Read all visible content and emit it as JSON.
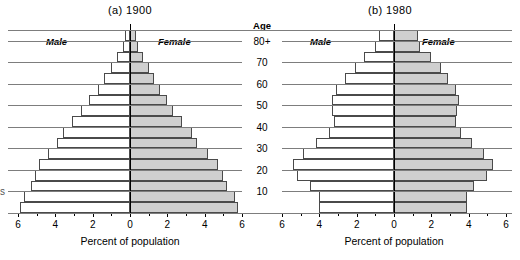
{
  "figure": {
    "age_axis_header": "Age",
    "age_tick_labels": [
      "10",
      "20",
      "30",
      "40",
      "50",
      "60",
      "70",
      "80+"
    ],
    "edge_artifact": "s"
  },
  "panels": [
    {
      "id": "panel-a",
      "title": "(a)  1900",
      "male_label": "Male",
      "female_label": "Female",
      "axis_title": "Percent of population",
      "x_tick_labels": [
        "6",
        "4",
        "2",
        "0",
        "2",
        "4",
        "6"
      ]
    },
    {
      "id": "panel-b",
      "title": "(b)  1980",
      "male_label": "Male",
      "female_label": "Female",
      "axis_title": "Percent of population",
      "x_tick_labels": [
        "6",
        "4",
        "2",
        "0",
        "2",
        "4",
        "6"
      ]
    }
  ],
  "colors": {
    "male_fill": "#ffffff",
    "female_fill": "#cfcfcf",
    "bar_stroke": "#4a4a4a",
    "axis": "#000000",
    "gridline": "#7d7d7d"
  },
  "chart_data": [
    {
      "type": "bar",
      "subtype": "population-pyramid",
      "title": "(a)  1900",
      "xlabel": "Percent of population",
      "ylabel": "Age",
      "xlim": [
        -6,
        6
      ],
      "xticks": [
        -6,
        -4,
        -2,
        0,
        2,
        4,
        6
      ],
      "xticklabels": [
        "6",
        "4",
        "2",
        "0",
        "2",
        "4",
        "6"
      ],
      "grid": true,
      "legend": [
        "Male",
        "Female"
      ],
      "legend_position": "inside-top",
      "categories": [
        "0-4",
        "5-9",
        "10-14",
        "15-19",
        "20-24",
        "25-29",
        "30-34",
        "35-39",
        "40-44",
        "45-49",
        "50-54",
        "55-59",
        "60-64",
        "65-69",
        "70-74",
        "75-79",
        "80+"
      ],
      "age_ticks": [
        10,
        20,
        30,
        40,
        50,
        60,
        70,
        80
      ],
      "series": [
        {
          "name": "Male",
          "values": [
            5.9,
            5.7,
            5.3,
            5.1,
            4.9,
            4.4,
            3.9,
            3.6,
            3.1,
            2.6,
            2.2,
            1.7,
            1.4,
            1.0,
            0.7,
            0.4,
            0.25
          ]
        },
        {
          "name": "Female",
          "values": [
            5.8,
            5.6,
            5.2,
            5.0,
            4.7,
            4.2,
            3.6,
            3.3,
            2.8,
            2.3,
            2.0,
            1.6,
            1.3,
            1.0,
            0.7,
            0.45,
            0.3
          ]
        }
      ]
    },
    {
      "type": "bar",
      "subtype": "population-pyramid",
      "title": "(b)  1980",
      "xlabel": "Percent of population",
      "ylabel": "Age",
      "xlim": [
        -6,
        6
      ],
      "xticks": [
        -6,
        -4,
        -2,
        0,
        2,
        4,
        6
      ],
      "xticklabels": [
        "6",
        "4",
        "2",
        "0",
        "2",
        "4",
        "6"
      ],
      "grid": true,
      "legend": [
        "Male",
        "Female"
      ],
      "legend_position": "inside-top",
      "categories": [
        "0-4",
        "5-9",
        "10-14",
        "15-19",
        "20-24",
        "25-29",
        "30-34",
        "35-39",
        "40-44",
        "45-49",
        "50-54",
        "55-59",
        "60-64",
        "65-69",
        "70-74",
        "75-79",
        "80+"
      ],
      "age_ticks": [
        10,
        20,
        30,
        40,
        50,
        60,
        70,
        80
      ],
      "series": [
        {
          "name": "Male",
          "values": [
            4.0,
            4.0,
            4.5,
            5.2,
            5.4,
            4.9,
            4.2,
            3.5,
            3.2,
            3.3,
            3.3,
            3.1,
            2.6,
            2.1,
            1.6,
            1.0,
            0.8
          ]
        },
        {
          "name": "Female",
          "values": [
            3.9,
            3.9,
            4.3,
            5.0,
            5.3,
            4.8,
            4.2,
            3.6,
            3.3,
            3.4,
            3.5,
            3.3,
            2.9,
            2.5,
            2.0,
            1.4,
            1.3
          ]
        }
      ]
    }
  ]
}
